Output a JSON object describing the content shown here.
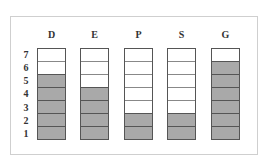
{
  "levels": [
    "7",
    "6",
    "5",
    "4",
    "3",
    "2",
    "1"
  ],
  "columns": [
    {
      "label": "D",
      "filled": 5,
      "total": 7
    },
    {
      "label": "E",
      "filled": 4,
      "total": 7
    },
    {
      "label": "P",
      "filled": 2,
      "total": 7
    },
    {
      "label": "S",
      "filled": 2,
      "total": 7
    },
    {
      "label": "G",
      "filled": 6,
      "total": 7
    }
  ],
  "colors": {
    "filled": "#a9a9a9",
    "empty": "#ffffff",
    "border": "#555555"
  }
}
